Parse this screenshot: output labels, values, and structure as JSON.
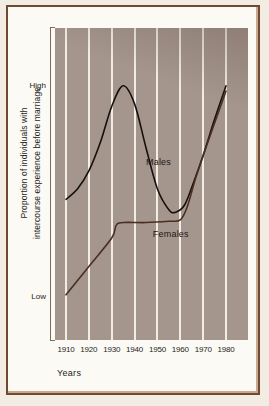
{
  "figure": {
    "x_axis_title": "Years",
    "y_axis_title_line1": "Proportion of individuals with",
    "y_axis_title_line2": "intercourse experience before marriage"
  },
  "chart_data": {
    "type": "line",
    "title": "",
    "xlabel": "Years",
    "ylabel": "Proportion of individuals with intercourse experience before marriage",
    "xlim": [
      1910,
      1980
    ],
    "ylim_labels": [
      "Low",
      "High"
    ],
    "grid": "vertical",
    "legend": "inline-labels",
    "xticks": [
      1910,
      1920,
      1930,
      1940,
      1950,
      1960,
      1970,
      1980
    ],
    "ytick_labels": [
      {
        "label": "High",
        "position": "0.90"
      },
      {
        "label": "Low",
        "position": "0.08"
      }
    ],
    "series": [
      {
        "name": "Males",
        "color": "#15100d",
        "label_x": 1945,
        "label_y": 0.6,
        "points": [
          {
            "x": 1910,
            "y": 0.46
          },
          {
            "x": 1915,
            "y": 0.5
          },
          {
            "x": 1920,
            "y": 0.57
          },
          {
            "x": 1925,
            "y": 0.68
          },
          {
            "x": 1930,
            "y": 0.82
          },
          {
            "x": 1935,
            "y": 0.9
          },
          {
            "x": 1940,
            "y": 0.83
          },
          {
            "x": 1945,
            "y": 0.66
          },
          {
            "x": 1950,
            "y": 0.5
          },
          {
            "x": 1955,
            "y": 0.42
          },
          {
            "x": 1958,
            "y": 0.41
          },
          {
            "x": 1962,
            "y": 0.44
          },
          {
            "x": 1966,
            "y": 0.53
          },
          {
            "x": 1970,
            "y": 0.63
          },
          {
            "x": 1975,
            "y": 0.77
          },
          {
            "x": 1980,
            "y": 0.9
          }
        ]
      },
      {
        "name": "Females",
        "color": "#4a2e22",
        "label_x": 1948,
        "label_y": 0.32,
        "points": [
          {
            "x": 1910,
            "y": 0.09
          },
          {
            "x": 1920,
            "y": 0.2
          },
          {
            "x": 1930,
            "y": 0.31
          },
          {
            "x": 1932,
            "y": 0.36
          },
          {
            "x": 1935,
            "y": 0.37
          },
          {
            "x": 1945,
            "y": 0.37
          },
          {
            "x": 1955,
            "y": 0.375
          },
          {
            "x": 1960,
            "y": 0.38
          },
          {
            "x": 1963,
            "y": 0.43
          },
          {
            "x": 1967,
            "y": 0.55
          },
          {
            "x": 1972,
            "y": 0.68
          },
          {
            "x": 1976,
            "y": 0.78
          },
          {
            "x": 1980,
            "y": 0.88
          }
        ]
      }
    ]
  },
  "colors": {
    "plot_background": "#a5968d",
    "gridline": "#f2ece4",
    "frame_border": "#6e4a33",
    "paper": "#f3ece2",
    "males_line": "#15100d",
    "females_line": "#4a2e22"
  }
}
